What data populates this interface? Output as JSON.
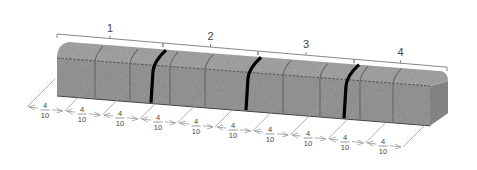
{
  "diagram": {
    "sections": [
      {
        "label": "1",
        "x1": 57,
        "x2": 163,
        "ly": 14
      },
      {
        "label": "2",
        "x1": 163,
        "x2": 258,
        "ly": 26
      },
      {
        "label": "3",
        "x1": 258,
        "x2": 354,
        "ly": 38
      },
      {
        "label": "4",
        "x1": 354,
        "x2": 447,
        "ly": 50
      }
    ],
    "cuts": [
      152,
      247,
      345
    ],
    "segment_label": {
      "numerator": "4",
      "denominator": "10"
    },
    "segments": [
      {
        "x": 45,
        "y": 110
      },
      {
        "x": 82,
        "y": 114
      },
      {
        "x": 120,
        "y": 118
      },
      {
        "x": 158,
        "y": 122
      },
      {
        "x": 196,
        "y": 126
      },
      {
        "x": 233,
        "y": 130
      },
      {
        "x": 270,
        "y": 134
      },
      {
        "x": 308,
        "y": 138
      },
      {
        "x": 345,
        "y": 142
      },
      {
        "x": 383,
        "y": 146
      }
    ],
    "colors": {
      "bar": "#9a9a9a",
      "bar_top": "#a8a8a8",
      "bar_side": "#8c8c8c",
      "cut": "#000000",
      "lines": "#888888"
    }
  }
}
